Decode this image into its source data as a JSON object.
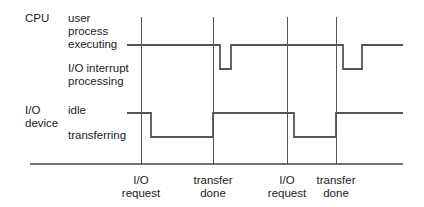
{
  "diagram": {
    "cpu": {
      "name": "CPU",
      "state_high": "user\nprocess\nexecuting",
      "state_low": "I/O interrupt\nprocessing"
    },
    "io": {
      "name": "I/O\ndevice",
      "state_high": "idle",
      "state_low": "transferring"
    },
    "events": [
      {
        "label": "I/O\nrequest"
      },
      {
        "label": "transfer\ndone"
      },
      {
        "label": "I/O\nrequest"
      },
      {
        "label": "transfer\ndone"
      }
    ],
    "colors": {
      "line": "#555555",
      "text": "#222222"
    }
  }
}
